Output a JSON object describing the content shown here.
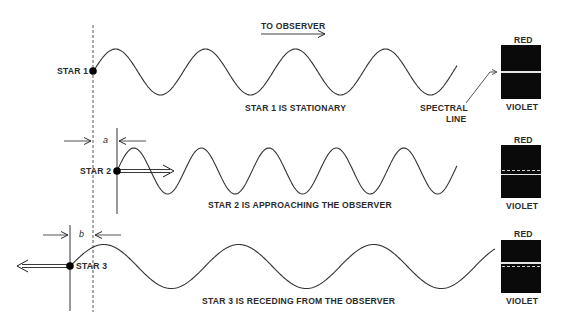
{
  "header": {
    "direction_label": "TO OBSERVER"
  },
  "reference_line": {
    "x": 93,
    "style": "dashed"
  },
  "rows": [
    {
      "star_label": "STAR 1",
      "caption": "STAR 1 IS STATIONARY",
      "motion": "stationary",
      "wavelength_px": 90,
      "spectrum": {
        "top_label": "RED",
        "bottom_label": "VIOLET",
        "line_position": "center",
        "dashed_reference": false
      },
      "annotation": "SPECTRAL LINE"
    },
    {
      "star_label": "STAR 2",
      "caption": "STAR 2 IS APPROACHING THE OBSERVER",
      "motion": "approaching",
      "offset_label": "a",
      "wavelength_px": 67.5,
      "spectrum": {
        "top_label": "RED",
        "bottom_label": "VIOLET",
        "line_position": "shifted toward violet",
        "dashed_reference": true
      }
    },
    {
      "star_label": "STAR 3",
      "caption": "STAR 3 IS RECEDING FROM THE OBSERVER",
      "motion": "receding",
      "offset_label": "b",
      "wavelength_px": 135,
      "spectrum": {
        "top_label": "RED",
        "bottom_label": "VIOLET",
        "line_position": "shifted toward red",
        "dashed_reference": true
      }
    }
  ],
  "spectral_line_label": {
    "line1": "SPECTRAL",
    "line2": "LINE"
  }
}
